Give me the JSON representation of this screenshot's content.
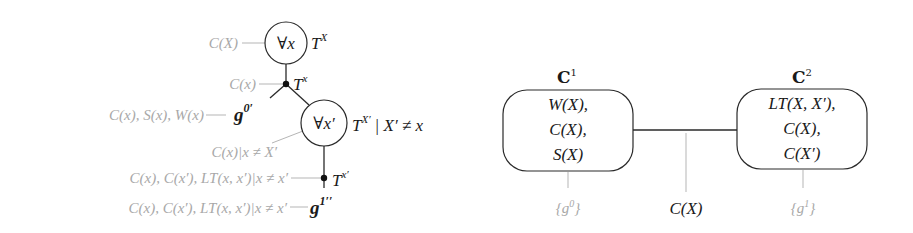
{
  "left_diagram": {
    "root_node": {
      "symbol": "∀x",
      "label_base": "T",
      "label_sup": "X",
      "evidence": "C(X)"
    },
    "junction_1": {
      "label_base": "T",
      "label_sup": "x",
      "evidence": "C(x)"
    },
    "leaf_g0": {
      "label_base": "g",
      "label_sup": "0′",
      "evidence": "C(x), S(x), W(x)"
    },
    "inner_node": {
      "symbol": "∀x′",
      "label_base": "T",
      "label_sup": "X′",
      "constraint": "| X′ ≠ x",
      "evidence": "C(x)|x ≠ X′"
    },
    "junction_2": {
      "label_base": "T",
      "label_sup": "x′",
      "evidence": "C(x), C(x′), LT(x, x′)|x ≠ x′"
    },
    "leaf_g1": {
      "label_base": "g",
      "label_sup": "1′′",
      "evidence": "C(x), C(x′), LT(x, x′)|x ≠ x′"
    }
  },
  "right_diagram": {
    "clusters": [
      {
        "title_base": "C",
        "title_sup": "1",
        "lines": [
          "W(X),",
          "C(X),",
          "S(X)"
        ],
        "group": "{g",
        "group_sup": "0",
        "group_end": "}"
      },
      {
        "title_base": "C",
        "title_sup": "2",
        "lines": [
          "LT(X, X′),",
          "C(X),",
          "C(X′)"
        ],
        "group": "{g",
        "group_sup": "1",
        "group_end": "}"
      }
    ],
    "separator": "C(X)"
  },
  "colors": {
    "dark": "#1a1a1a",
    "light": "#a8a8a8",
    "edge": "#2a2a2a"
  }
}
